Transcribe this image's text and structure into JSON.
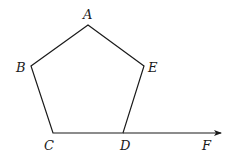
{
  "diagram": {
    "type": "geometry",
    "stroke_color": "#1a1a1a",
    "vertices": {
      "A": {
        "x": 88,
        "y": 25
      },
      "B": {
        "x": 31,
        "y": 66
      },
      "C": {
        "x": 53,
        "y": 133
      },
      "D": {
        "x": 123,
        "y": 133
      },
      "E": {
        "x": 144,
        "y": 66
      }
    },
    "ray_end": {
      "x": 222,
      "y": 133
    },
    "labels": {
      "A": "A",
      "B": "B",
      "C": "C",
      "D": "D",
      "E": "E",
      "F": "F"
    }
  }
}
